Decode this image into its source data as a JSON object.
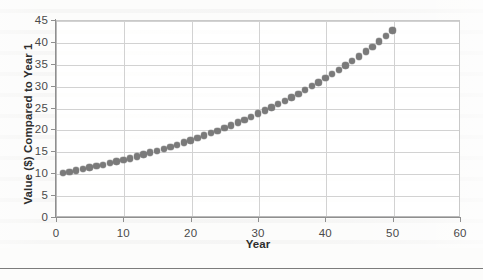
{
  "page": {
    "background_color": "#fcfcfb",
    "footer_rule_color": "#7c7c7c",
    "footer_note": ""
  },
  "chart_data": {
    "type": "scatter",
    "title": "",
    "xlabel": "Year",
    "ylabel": "Value ($) Compared to Year 1",
    "xlim": [
      0,
      60
    ],
    "ylim": [
      0,
      45
    ],
    "xticks": [
      0,
      10,
      20,
      30,
      40,
      50,
      60
    ],
    "yticks": [
      0,
      5,
      10,
      15,
      20,
      25,
      30,
      35,
      40,
      45
    ],
    "grid": true,
    "legend": "none",
    "marker_color": "#7a7a7a",
    "marker_shape": "circle",
    "series": [
      {
        "name": "Value ($) Compared to Year 1",
        "x": [
          1,
          2,
          3,
          4,
          5,
          6,
          7,
          8,
          9,
          10,
          11,
          12,
          13,
          14,
          15,
          16,
          17,
          18,
          19,
          20,
          21,
          22,
          23,
          24,
          25,
          26,
          27,
          28,
          29,
          30,
          31,
          32,
          33,
          34,
          35,
          36,
          37,
          38,
          39,
          40,
          41,
          42,
          43,
          44,
          45,
          46,
          47,
          48,
          49,
          50
        ],
        "values": [
          10.0,
          10.3,
          10.6,
          10.9,
          11.3,
          11.6,
          11.9,
          12.3,
          12.7,
          13.0,
          13.4,
          13.8,
          14.3,
          14.7,
          15.1,
          15.6,
          16.0,
          16.5,
          17.0,
          17.5,
          18.1,
          18.6,
          19.2,
          19.7,
          20.3,
          20.9,
          21.6,
          22.2,
          22.9,
          23.6,
          24.3,
          25.0,
          25.8,
          26.5,
          27.3,
          28.1,
          29.0,
          29.9,
          30.7,
          31.7,
          32.6,
          33.6,
          34.6,
          35.6,
          36.7,
          37.8,
          38.9,
          40.1,
          41.3,
          42.6
        ]
      }
    ]
  }
}
